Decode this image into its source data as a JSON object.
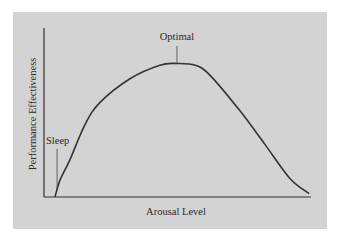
{
  "chart_data": {
    "type": "line",
    "title": "",
    "xlabel": "Arousal Level",
    "ylabel": "Performance Effectiveness",
    "xlim": [
      0,
      100
    ],
    "ylim": [
      0,
      100
    ],
    "grid": false,
    "legend": null,
    "series": [
      {
        "name": "Performance vs Arousal",
        "x": [
          4.1,
          6.0,
          9.7,
          15.4,
          21.0,
          32.2,
          43.4,
          49.8,
          56.6,
          62.2,
          73.4,
          82.8,
          92.1,
          99.3
        ],
        "y": [
          0,
          10,
          22,
          43,
          56,
          70,
          78,
          79,
          78,
          72,
          51,
          31,
          11,
          2
        ]
      }
    ],
    "annotations": [
      {
        "text": "Sleep",
        "x": 4.9,
        "y": 4
      },
      {
        "text": "Optimal",
        "x": 49.8,
        "y": 79
      }
    ],
    "colors": {
      "panel": "#d3d3d3",
      "line": "#333333",
      "text": "#2a2a2a"
    }
  }
}
